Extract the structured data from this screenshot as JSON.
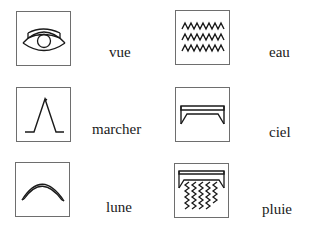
{
  "title": "",
  "items": [
    {
      "word": "vue",
      "icon": "eye-icon"
    },
    {
      "word": "eau",
      "icon": "water-waves-icon"
    },
    {
      "word": "marcher",
      "icon": "walking-legs-icon"
    },
    {
      "word": "ciel",
      "icon": "sky-icon"
    },
    {
      "word": "lune",
      "icon": "moon-crescent-icon"
    },
    {
      "word": "pluie",
      "icon": "rain-icon"
    }
  ],
  "colors": {
    "stroke": "#1a1a1a",
    "box_border": "#6e6e6e",
    "background": "#ffffff"
  }
}
